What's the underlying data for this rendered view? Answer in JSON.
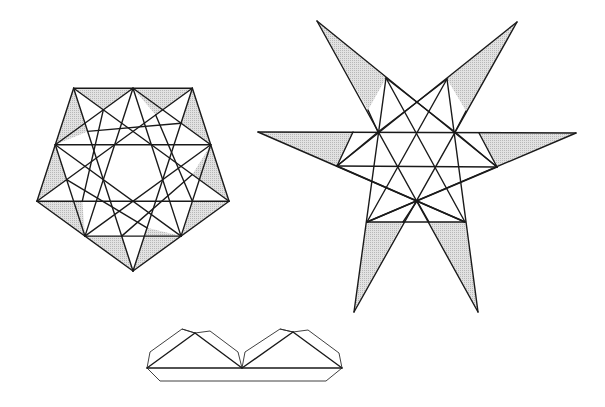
{
  "figure": {
    "shade_color": "#d4d4d4",
    "line_color": "#1a1a1a",
    "background": "#ffffff",
    "panels": [
      {
        "id": "pentagon-net",
        "label": "Pentagon with inscribed stars and shaded corner triangles",
        "shaded_triangles": 10
      },
      {
        "id": "star-net",
        "label": "Six-pointed star net with shaded arm triangles",
        "shaded_triangles": 6
      },
      {
        "id": "profile-view",
        "label": "Side profile of two-peaked solid"
      }
    ]
  }
}
